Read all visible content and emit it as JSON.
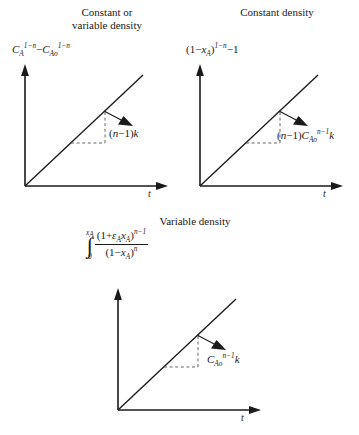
{
  "figure": {
    "type": "three-panel-linear-plot",
    "axis_color": "#1a1a1a",
    "line_color": "#1a1a1a",
    "dash_color": "#555555"
  },
  "panels": [
    {
      "id": "constant-or-variable-density",
      "title_line1": "Constant or",
      "title_line2": "variable density",
      "y_axis_label": "C_A^{1-n} - C_Ao^{1-n}",
      "x_axis_label": "t",
      "slope_label": "(n-1)k",
      "slope_value": 1.0,
      "intercept": 0,
      "origin": [
        25,
        186
      ],
      "x_axis_end": [
        168,
        186
      ],
      "y_axis_top": [
        25,
        70
      ],
      "line_end": [
        143,
        75
      ]
    },
    {
      "id": "constant-density",
      "title_line1": "Constant density",
      "title_line2": "",
      "y_axis_label": "(1-x_A)^{1-n} - 1",
      "x_axis_label": "t",
      "slope_label": "(n-1)C_Ao^{n-1}k",
      "slope_value": 1.0,
      "intercept": 0,
      "origin": [
        200,
        186
      ],
      "x_axis_end": [
        343,
        186
      ],
      "y_axis_top": [
        200,
        70
      ],
      "line_end": [
        318,
        75
      ]
    },
    {
      "id": "variable-density",
      "title_line1": "Variable density",
      "title_line2": "",
      "y_axis_label": "integral from 0 to x_A of (1 + e_A x_A)^{n-1} / (1 - x_A)^n",
      "x_axis_label": "t",
      "slope_label": "C_Ao^{n-1}k",
      "slope_value": 1.0,
      "intercept": 0,
      "origin": [
        118,
        410
      ],
      "x_axis_end": [
        261,
        410
      ],
      "y_axis_top": [
        118,
        294
      ],
      "line_end": [
        236,
        299
      ]
    }
  ],
  "labels": {
    "x_axis_t": "t",
    "panel1_slope": "(n−1)k",
    "panel2_slope": "(n−1)C",
    "panel3_slope": "C"
  },
  "math": {
    "C": "C",
    "A_sub": "A",
    "Ao_sub": "Ao",
    "one_minus_n": "1−n",
    "n_minus_one": "n−1",
    "n": "n",
    "k": "k",
    "x": "x",
    "epsilon": "ε",
    "one": "1",
    "zero": "0",
    "minus": "−",
    "plus": "+",
    "lparen": "(",
    "rparen": ")",
    "integral_sign": "∫"
  }
}
